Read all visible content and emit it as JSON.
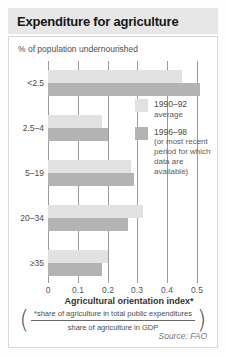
{
  "title": "Expenditure for agriculture",
  "subtitle": "% of population undernourished",
  "chart_data": {
    "type": "bar",
    "orientation": "horizontal",
    "title": "Expenditure for agriculture",
    "ylabel": "% of population undernourished",
    "xlabel": "Agricultural orientation index*",
    "categories": [
      "<2.5",
      "2.5–4",
      "5–19",
      "20–34",
      "≥35"
    ],
    "series": [
      {
        "name": "1990–92 average",
        "values": [
          0.45,
          0.18,
          0.28,
          0.32,
          0.2
        ],
        "color": "#e1e1e1"
      },
      {
        "name": "1996–98 (or most recent period for which data are available)",
        "values": [
          0.51,
          0.2,
          0.29,
          0.27,
          0.18
        ],
        "color": "#b3b3b3"
      }
    ],
    "xlim": [
      0,
      0.5
    ],
    "xticks": [
      0,
      0.1,
      0.2,
      0.3,
      0.4,
      0.5
    ],
    "xtick_labels": [
      "0",
      "0.1",
      "0.2",
      "0.3",
      "0.4",
      "0.5"
    ],
    "grid": true,
    "legend_position": "inside-right"
  },
  "legend": {
    "items": [
      {
        "label": "1990–92",
        "sublabel": "average"
      },
      {
        "label": "1996–98",
        "sublabel": "(or most recent period for which data are available)"
      }
    ]
  },
  "footnote": {
    "open_paren": "(",
    "numerator": "*share of agriculture in total public expenditures",
    "denominator": "share of agriculture in GDP",
    "close_paren": ")"
  },
  "source": "Source: FAO",
  "colors": {
    "bar_1990_92": "#e1e1e1",
    "bar_1996_98": "#b3b3b3",
    "gridline": "#9a9a9a",
    "title_strip_bg": "#e7e7e7",
    "panel_border": "#d9d9d9",
    "text": "#4d4d4d",
    "title_text": "#161616"
  }
}
